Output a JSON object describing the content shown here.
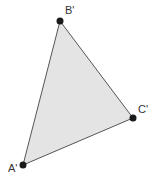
{
  "diagram": {
    "type": "triangle",
    "fill_color": "#e4e4e4",
    "stroke_color": "#555555",
    "point_color": "#1a1a1a",
    "vertices": [
      {
        "label": "A'",
        "x": 23,
        "y": 165
      },
      {
        "label": "B'",
        "x": 60,
        "y": 21
      },
      {
        "label": "C'",
        "x": 133,
        "y": 118
      }
    ]
  }
}
